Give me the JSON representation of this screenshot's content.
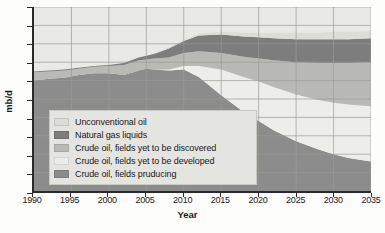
{
  "chart_data": {
    "type": "area",
    "stacked": true,
    "title": "",
    "xlabel": "Year",
    "ylabel": "mb/d",
    "xlim": [
      1990,
      2035
    ],
    "ylim": [
      0,
      100
    ],
    "grid": true,
    "legend_position": "inside-lower-left",
    "xticks": [
      "1990",
      "1995",
      "2000",
      "2005",
      "2010",
      "2015",
      "2020",
      "2025",
      "2030",
      "2035"
    ],
    "yticks": [
      "0",
      "10",
      "20",
      "30",
      "40",
      "50",
      "60",
      "70",
      "80",
      "90",
      "100"
    ],
    "x": [
      1990,
      1992,
      1994,
      1996,
      1998,
      2000,
      2002,
      2004,
      2005,
      2006,
      2008,
      2010,
      2012,
      2015,
      2018,
      2020,
      2022,
      2025,
      2028,
      2030,
      2032,
      2035
    ],
    "series": [
      {
        "name": "Crude oil, fields producing",
        "color": "#8c8c8c",
        "values": [
          60.0,
          61.0,
          61.5,
          63.0,
          64.0,
          64.0,
          63.0,
          65.5,
          66.5,
          66.0,
          65.5,
          66.0,
          62.0,
          52.0,
          43.0,
          38.0,
          33.0,
          27.0,
          22.5,
          20.0,
          18.0,
          16.0
        ]
      },
      {
        "name": "Crude oil, fields yet to be developed",
        "color": "#ededea",
        "values": [
          0.0,
          0.0,
          0.0,
          0.0,
          0.0,
          0.0,
          0.0,
          0.0,
          0.0,
          0.0,
          0.5,
          2.0,
          6.0,
          14.0,
          19.0,
          21.5,
          23.5,
          25.5,
          27.0,
          28.0,
          29.0,
          30.0
        ]
      },
      {
        "name": "Crude oil, fields yet to be discovered",
        "color": "#b9b9b5",
        "values": [
          4.5,
          4.0,
          4.0,
          3.5,
          3.5,
          4.0,
          5.5,
          5.5,
          5.0,
          6.0,
          6.5,
          7.0,
          8.0,
          9.0,
          11.0,
          12.5,
          14.5,
          17.5,
          20.0,
          21.5,
          22.5,
          24.0
        ]
      },
      {
        "name": "Natural gas liquids",
        "color": "#7d7d7d",
        "values": [
          0.5,
          0.5,
          0.5,
          0.5,
          0.5,
          0.5,
          1.0,
          1.5,
          2.0,
          2.5,
          5.0,
          6.5,
          8.5,
          10.0,
          11.0,
          11.5,
          12.0,
          12.5,
          13.0,
          13.0,
          13.0,
          13.0
        ]
      },
      {
        "name": "Unconventional oil",
        "color": "#dcdcd8",
        "values": [
          0.0,
          0.0,
          0.0,
          0.0,
          0.0,
          0.0,
          0.0,
          0.0,
          0.0,
          0.0,
          0.5,
          0.5,
          1.0,
          1.5,
          2.0,
          2.5,
          3.0,
          3.5,
          3.5,
          4.0,
          4.0,
          4.0
        ]
      }
    ],
    "legend_order": [
      "Unconventional oil",
      "Natural gas liquids",
      "Crude oil, fields yet to be discovered",
      "Crude oil, fields yet to be developed",
      "Crude oil, fields pruducing"
    ],
    "legend": [
      {
        "label": "Unconventional oil",
        "color": "#dcdcd8"
      },
      {
        "label": "Natural gas liquids",
        "color": "#7d7d7d"
      },
      {
        "label": "Crude oil, fields yet to be discovered",
        "color": "#b9b9b5"
      },
      {
        "label": "Crude oil, fields yet to be developed",
        "color": "#ededea"
      },
      {
        "label": "Crude oil, fields pruducing",
        "color": "#8c8c8c"
      }
    ],
    "plot_background": "#e9e9e6",
    "grid_color": "#9a9a96",
    "axis_color": "#2a2a2a"
  }
}
